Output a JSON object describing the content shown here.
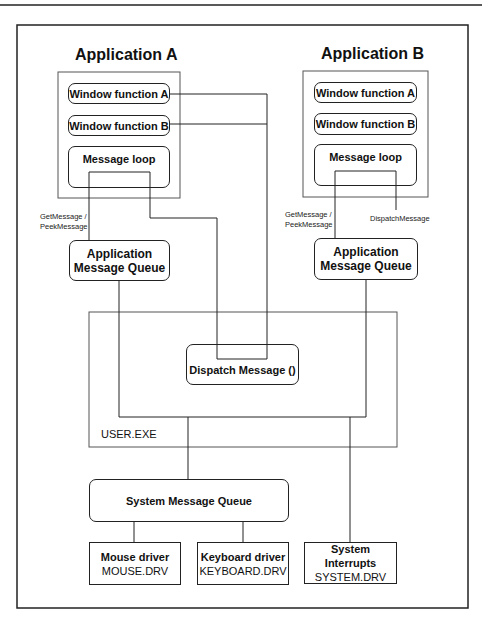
{
  "diagram": {
    "app_a": {
      "title": "Application A",
      "window_a": "Window function A",
      "window_b": "Window function B",
      "message_loop": "Message loop",
      "get_label_1": "GetMessage /",
      "get_label_2": "PeekMessage",
      "queue_1": "Application",
      "queue_2": "Message Queue"
    },
    "app_b": {
      "title": "Application B",
      "window_a": "Window function A",
      "window_b": "Window function B",
      "message_loop": "Message loop",
      "get_label_1": "GetMessage /",
      "get_label_2": "PeekMessage",
      "dispatch_label": "DispatchMessage",
      "queue_1": "Application",
      "queue_2": "Message Queue"
    },
    "user_exe": {
      "label": "USER.EXE",
      "dispatch": "Dispatch Message ()"
    },
    "system_queue": "System Message Queue",
    "drivers": [
      {
        "name": "Mouse driver",
        "file": "MOUSE.DRV"
      },
      {
        "name": "Keyboard driver",
        "file": "KEYBOARD.DRV"
      },
      {
        "name": "System Interrupts",
        "file": "SYSTEM.DRV"
      }
    ]
  }
}
